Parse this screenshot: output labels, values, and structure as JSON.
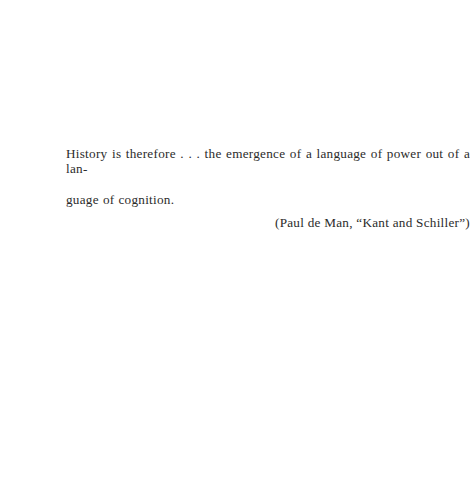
{
  "page": {
    "background_color": "#ffffff",
    "text_color": "#2b2b2b",
    "width": 456,
    "height": 481
  },
  "epigraph": {
    "quote_line_1": "History is therefore . . . the emergence of a language of power out of a lan-",
    "quote_line_2": "guage of cognition.",
    "attribution": "(Paul de Man, “Kant and Schiller”)"
  }
}
